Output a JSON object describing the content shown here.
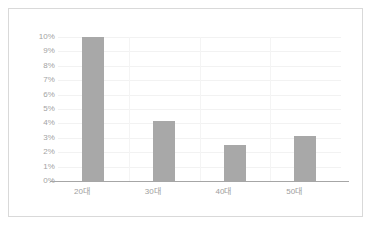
{
  "chart_data": {
    "type": "bar",
    "title": "",
    "subtitle": "",
    "xlabel": "",
    "ylabel": "",
    "categories": [
      "20대",
      "30대",
      "40대",
      "50대"
    ],
    "values": [
      10.0,
      4.2,
      2.5,
      3.1
    ],
    "value_labels": [
      "10%",
      "4.2%",
      "2.5%",
      "3.1%"
    ],
    "ylim": [
      0,
      10
    ],
    "ytick_values": [
      0,
      1,
      2,
      3,
      4,
      5,
      6,
      7,
      8,
      9,
      10
    ],
    "ytick_labels": [
      "0%",
      "1%",
      "2%",
      "3%",
      "4%",
      "5%",
      "6%",
      "7%",
      "8%",
      "9%",
      "10%"
    ],
    "grid": true,
    "grid_orientation": "horizontal-and-category-separators",
    "legend": false,
    "legend_position": "none",
    "series": [
      {
        "name": "",
        "values": [
          10.0,
          4.2,
          2.5,
          3.1
        ]
      }
    ],
    "unit": "percent",
    "colors": {
      "bar_fill": "#a8a8a8",
      "gridline": "#f2f2f2",
      "category_separator": "#f4f4f4",
      "axis_line": "#a6a6a6",
      "tick_label": "#a3a3a3",
      "category_label": "#9e9e9e",
      "frame_border": "#d9d9d9",
      "background": "#ffffff"
    }
  }
}
